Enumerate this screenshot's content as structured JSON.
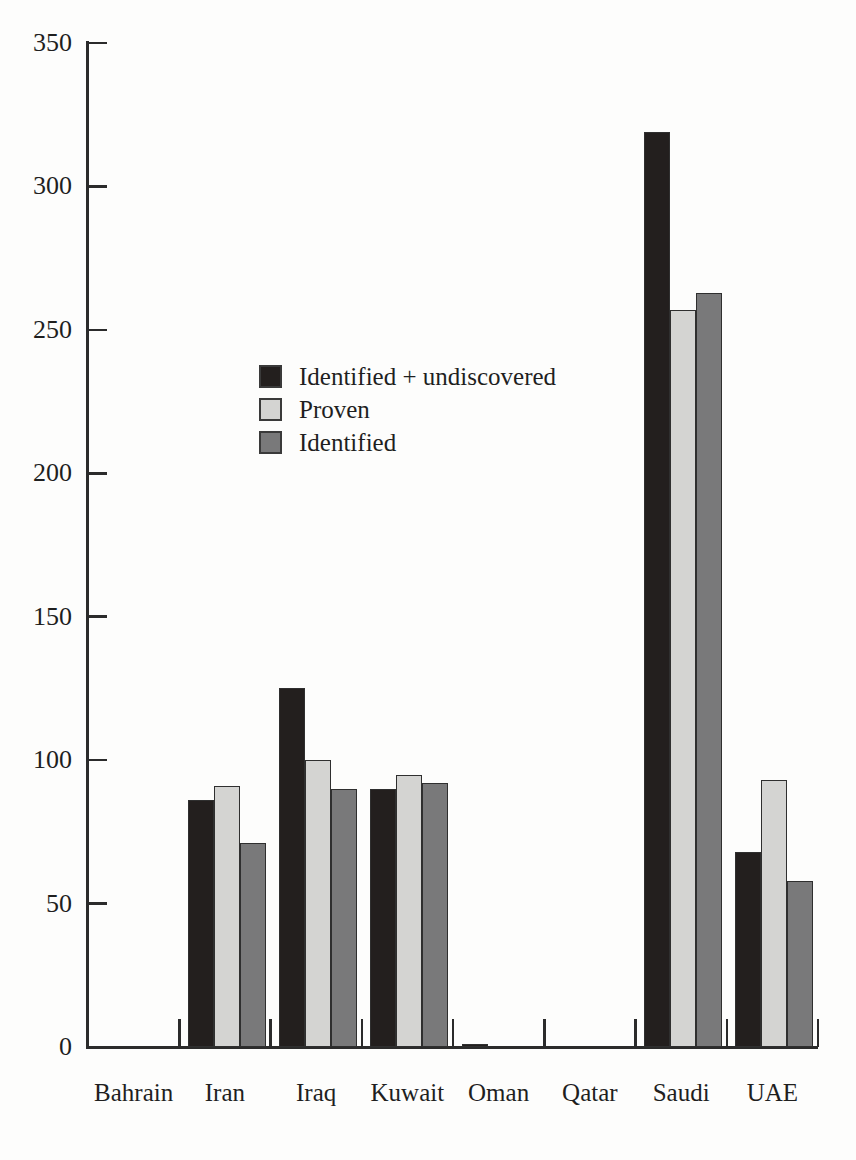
{
  "chart_data": {
    "type": "bar",
    "title": "",
    "subtitle": "",
    "xlabel": "",
    "ylabel": "",
    "ylim": [
      0,
      350
    ],
    "yticks": [
      0,
      50,
      100,
      150,
      200,
      250,
      300,
      350
    ],
    "ytick_labels": [
      "0",
      "50",
      "100",
      "150",
      "200",
      "250",
      "300",
      "350"
    ],
    "grid": false,
    "legend_position": "inside-upper-left",
    "categories": [
      "Bahrain",
      "Iran",
      "Iraq",
      "Kuwait",
      "Oman",
      "Qatar",
      "Saudi",
      "UAE"
    ],
    "series": [
      {
        "name": "Identified + undiscovered",
        "color": "#231f1e",
        "values": [
          0,
          86,
          125,
          90,
          1,
          0,
          319,
          68
        ]
      },
      {
        "name": "Proven",
        "color": "#d4d4d2",
        "values": [
          0,
          91,
          100,
          95,
          0,
          0,
          257,
          93
        ]
      },
      {
        "name": "Identified",
        "color": "#79797a",
        "values": [
          0,
          71,
          90,
          92,
          0,
          0,
          263,
          58
        ]
      }
    ]
  },
  "axes": {
    "y_tick_labels": [
      "350",
      "300",
      "250",
      "200",
      "150",
      "100",
      "50",
      "0"
    ],
    "x_tick_labels": [
      "Bahrain",
      "Iran",
      "Iraq",
      "Kuwait",
      "Oman",
      "Qatar",
      "Saudi",
      "UAE"
    ]
  },
  "legend": {
    "items": [
      {
        "label": "Identified + undiscovered",
        "color": "#231f1e"
      },
      {
        "label": "Proven",
        "color": "#d4d4d2"
      },
      {
        "label": "Identified",
        "color": "#79797a"
      }
    ]
  }
}
